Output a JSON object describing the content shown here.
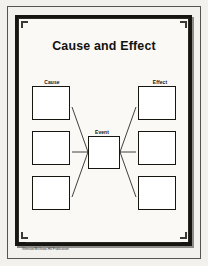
{
  "document": {
    "title": "Cause and Effect",
    "credit": "Glencoe/McGraw-Hill Publication"
  },
  "diagram": {
    "type": "cause-and-effect-graphic-organizer",
    "labels": {
      "cause": "Cause",
      "event": "Event",
      "effect": "Effect"
    },
    "cause_boxes": [
      {
        "id": "cause-1",
        "value": ""
      },
      {
        "id": "cause-2",
        "value": ""
      },
      {
        "id": "cause-3",
        "value": ""
      }
    ],
    "event_box": {
      "id": "event",
      "value": ""
    },
    "effect_boxes": [
      {
        "id": "effect-1",
        "value": ""
      },
      {
        "id": "effect-2",
        "value": ""
      },
      {
        "id": "effect-3",
        "value": ""
      }
    ]
  },
  "colors": {
    "paper": "#f2f1ee",
    "ink": "#16150f",
    "box_fill": "#ffffff",
    "shadow": "#131210",
    "backdrop": "#b9b9b6"
  }
}
